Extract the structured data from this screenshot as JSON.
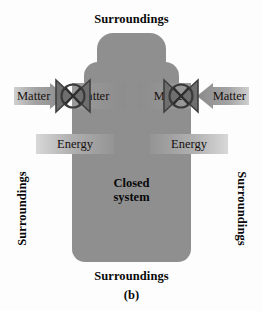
{
  "figure": {
    "panel_letter": "(b)",
    "system_label_line1": "Closed",
    "system_label_line2": "system"
  },
  "surroundings": {
    "top": "Surroundings",
    "bottom": "Surroundings",
    "left": "Surroundings",
    "right": "Surroundings"
  },
  "matter_flows": [
    {
      "position": "outer-left",
      "label": "Matter",
      "direction": "inward-right"
    },
    {
      "position": "inner-left",
      "label": "Matter",
      "direction": "inward-right"
    },
    {
      "position": "inner-right",
      "label": "Matter",
      "direction": "inward-left"
    },
    {
      "position": "outer-right",
      "label": "Matter",
      "direction": "inward-left"
    }
  ],
  "energy_flows": [
    {
      "position": "left",
      "label": "Energy"
    },
    {
      "position": "right",
      "label": "Energy"
    }
  ],
  "valves": [
    {
      "position": "left",
      "state": "closed",
      "icon": "closed-valve-icon"
    },
    {
      "position": "right",
      "state": "closed",
      "icon": "closed-valve-icon"
    }
  ],
  "colors": {
    "background": "#fdfdfd",
    "vessel_fill": "#8f8f8f",
    "band_gray": "#a3a3a3",
    "valve_stroke": "#4a4a4a",
    "text": "#080808"
  }
}
